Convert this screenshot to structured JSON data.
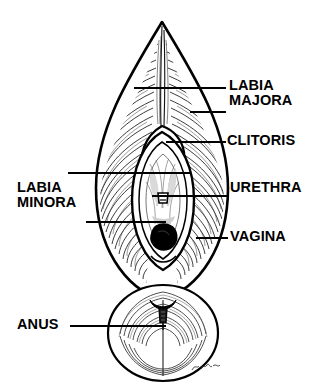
{
  "figure": {
    "style": "black-and-white pen-and-ink line drawing with hatching",
    "background_color": "#ffffff",
    "ink_color": "#000000",
    "signature": "DMc"
  },
  "labels": [
    {
      "id": "labia-majora",
      "line1": "LABIA",
      "line2": "MAJORA",
      "side": "right"
    },
    {
      "id": "clitoris",
      "line1": "CLITORIS",
      "line2": "",
      "side": "right"
    },
    {
      "id": "urethra",
      "line1": "URETHRA",
      "line2": "",
      "side": "right"
    },
    {
      "id": "vagina",
      "line1": "VAGINA",
      "line2": "",
      "side": "right"
    },
    {
      "id": "labia-minora",
      "line1": "LABIA",
      "line2": "MINORA",
      "side": "left"
    },
    {
      "id": "anus",
      "line1": "ANUS",
      "line2": "",
      "side": "left"
    }
  ]
}
